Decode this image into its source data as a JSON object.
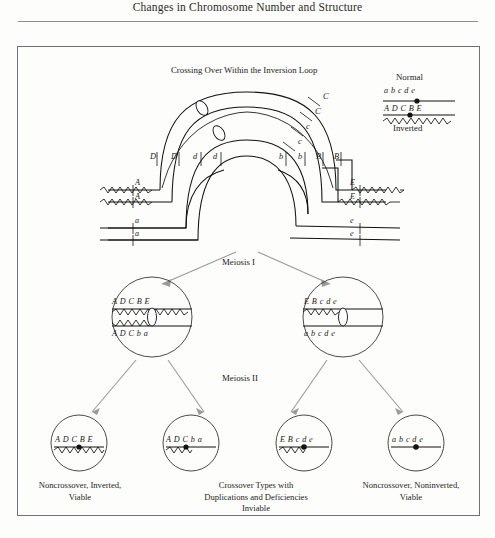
{
  "running_head": "Changes in Chromosome Number and Structure",
  "figure": {
    "top_title": "Crossing Over Within the Inversion Loop",
    "legend": {
      "normal_label": "Normal",
      "inverted_label": "Inverted",
      "normal_alleles": "a   b   c   d   e",
      "inverted_alleles": "A   D   C    B  E"
    },
    "loop_labels": {
      "left": [
        "D",
        "D",
        "d",
        "d"
      ],
      "right": [
        "b",
        "b",
        "B",
        "B"
      ],
      "upper_right": [
        "C",
        "C",
        "c",
        "c"
      ],
      "strand_left": [
        "A",
        "A",
        "a",
        "a"
      ],
      "strand_right": [
        "E",
        "E",
        "e",
        "e"
      ]
    },
    "meiosis_one_label": "Meiosis I",
    "meiosis_two_label": "Meiosis II",
    "meiosis_one_cells": [
      {
        "top_alleles": "A D   C  B E",
        "bottom_alleles": "A D   C  b  a"
      },
      {
        "top_alleles": "E  B    c    d e",
        "bottom_alleles": "a    b    c    d e"
      }
    ],
    "gametes": [
      {
        "alleles": "A D C B E"
      },
      {
        "alleles": "A D C   b a"
      },
      {
        "alleles": "E B c   d e"
      },
      {
        "alleles": "a b c   d e"
      }
    ],
    "captions": [
      {
        "lines": [
          "Noncrossover, Inverted,",
          "Viable"
        ]
      },
      {
        "lines": [
          "Crossover Types with",
          "Duplications and Deficiencies",
          "Inviable"
        ]
      },
      {
        "lines": [
          "Noncrossover, Noninverted,",
          "Viable"
        ]
      }
    ]
  },
  "colors": {
    "ink": "#111111",
    "arrow": "#9a9a9a",
    "frame": "#6f6f7a",
    "rule": "#8d8d8d"
  }
}
